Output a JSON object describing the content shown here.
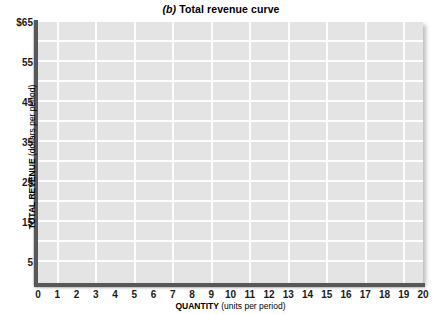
{
  "chart_data": {
    "type": "line",
    "title": "(b) Total revenue curve",
    "title_parts": {
      "panel_letter": "(b)",
      "title_text": " Total revenue curve"
    },
    "xlabel": "QUANTITY (units per period)",
    "xlabel_parts": {
      "strong": "QUANTITY",
      "normal": " (units per period)"
    },
    "ylabel": "TOTAL REVENUE (dollars per period)",
    "ylabel_parts": {
      "strong": "TOTAL REVENUE",
      "normal": " (dollars per period)"
    },
    "xlim": [
      0,
      20
    ],
    "ylim": [
      0,
      65
    ],
    "x_tick_labels": [
      "0",
      "1",
      "2",
      "3",
      "4",
      "5",
      "6",
      "7",
      "8",
      "9",
      "10",
      "11",
      "12",
      "13",
      "14",
      "15",
      "16",
      "17",
      "18",
      "19",
      "20"
    ],
    "x_tick_values": [
      0,
      1,
      2,
      3,
      4,
      5,
      6,
      7,
      8,
      9,
      10,
      11,
      12,
      13,
      14,
      15,
      16,
      17,
      18,
      19,
      20
    ],
    "y_tick_labels": [
      "$65",
      "55",
      "45",
      "35",
      "25",
      "15",
      "5"
    ],
    "y_tick_values": [
      65,
      55,
      45,
      35,
      25,
      15,
      5
    ],
    "y_gridline_values": [
      5,
      10,
      15,
      20,
      25,
      30,
      35,
      40,
      45,
      50,
      55,
      60
    ],
    "x_gridline_values": [
      1,
      3,
      5,
      7,
      9,
      11,
      13,
      15,
      17,
      19
    ],
    "grid": true,
    "legend": null,
    "series": [],
    "values": [],
    "categories": [],
    "annotations": [],
    "plot_background_color": "#e4e4e4",
    "gridline_color": "#fdfdfd",
    "axis_color": "#58585a",
    "note": "empty plotting grid; no data curve drawn"
  }
}
